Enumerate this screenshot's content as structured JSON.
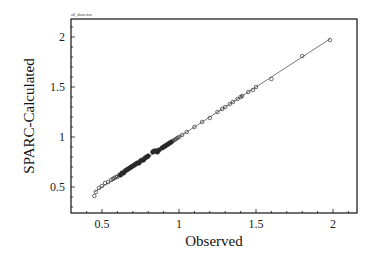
{
  "chart_data": {
    "type": "scatter",
    "title": "",
    "corner_label": "all_data.mo",
    "xlabel": "Observed",
    "ylabel": "SPARC-Calculated",
    "xlim": [
      0.31,
      2.17
    ],
    "ylim": [
      0.26,
      2.18
    ],
    "xticks": [
      0.5,
      1,
      1.5,
      2
    ],
    "xtick_labels": [
      "0.5",
      "1",
      "1.5",
      "2"
    ],
    "yticks": [
      0.5,
      1,
      1.5,
      2
    ],
    "ytick_labels": [
      "0.5",
      "1",
      "1.5",
      "2"
    ],
    "grid": false,
    "legend": null,
    "reference_line": {
      "from": [
        0.45,
        0.45
      ],
      "to": [
        1.98,
        1.98
      ],
      "label": "y = x"
    },
    "series": [
      {
        "name": "SPARC-Calculated vs Observed",
        "marker": "open-circle",
        "x": [
          0.45,
          0.46,
          0.48,
          0.5,
          0.52,
          0.54,
          0.56,
          0.57,
          0.58,
          0.59,
          0.6,
          0.61,
          0.62,
          0.63,
          0.64,
          0.65,
          0.66,
          0.67,
          0.68,
          0.69,
          0.7,
          0.71,
          0.72,
          0.73,
          0.74,
          0.75,
          0.76,
          0.77,
          0.78,
          0.79,
          0.8,
          0.83,
          0.84,
          0.85,
          0.86,
          0.87,
          0.89,
          0.9,
          0.91,
          0.92,
          0.93,
          0.94,
          0.95,
          0.96,
          0.97,
          0.98,
          0.99,
          1.0,
          1.02,
          1.05,
          1.1,
          1.15,
          1.2,
          1.25,
          1.28,
          1.3,
          1.33,
          1.35,
          1.38,
          1.4,
          1.41,
          1.45,
          1.48,
          1.5,
          1.6,
          1.8,
          1.98
        ],
        "y": [
          0.41,
          0.45,
          0.49,
          0.51,
          0.54,
          0.55,
          0.57,
          0.58,
          0.59,
          0.6,
          0.6,
          0.62,
          0.62,
          0.64,
          0.64,
          0.66,
          0.67,
          0.68,
          0.69,
          0.7,
          0.71,
          0.72,
          0.73,
          0.74,
          0.74,
          0.76,
          0.77,
          0.77,
          0.79,
          0.8,
          0.81,
          0.85,
          0.86,
          0.86,
          0.85,
          0.87,
          0.89,
          0.9,
          0.91,
          0.92,
          0.93,
          0.94,
          0.95,
          0.96,
          0.97,
          0.98,
          0.99,
          1.0,
          1.02,
          1.05,
          1.1,
          1.15,
          1.19,
          1.25,
          1.28,
          1.3,
          1.33,
          1.35,
          1.38,
          1.4,
          1.41,
          1.45,
          1.47,
          1.5,
          1.58,
          1.81,
          1.97
        ]
      }
    ]
  }
}
